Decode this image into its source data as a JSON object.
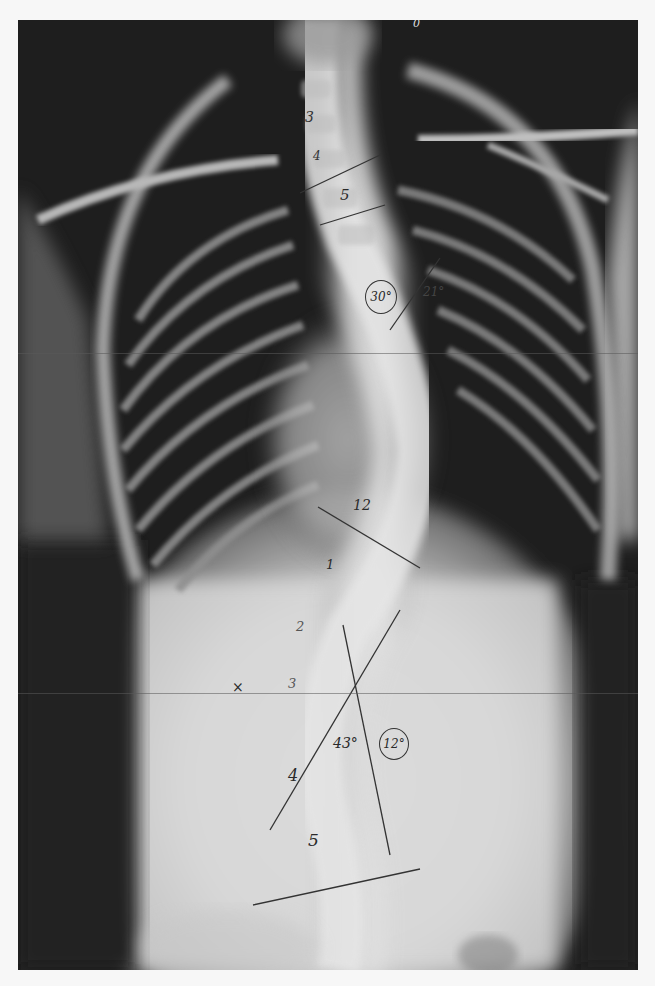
{
  "image": {
    "description": "Frontal (AP) radiograph of chest and spine showing scoliosis with handwritten Cobb angle measurements",
    "background_color": "#f7f7f7",
    "film_color": "#1c1c1c"
  },
  "annotations": {
    "top_mark": "0",
    "thoracic_levels": {
      "t3": "3",
      "t4": "4",
      "t5": "5",
      "t12": "12"
    },
    "thoracic_angle_circled": "30°",
    "thoracic_angle_side": "21°",
    "lumbar_levels": {
      "l1": "1",
      "l2": "2",
      "l3": "3",
      "l4": "4",
      "l5": "5"
    },
    "x_mark": "×",
    "lumbar_angle": "43°",
    "lumbar_angle_circled": "12°"
  },
  "measurement_lines": [
    {
      "name": "t4-endplate-line",
      "x1": 300,
      "y1": 193,
      "x2": 380,
      "y2": 155
    },
    {
      "name": "t5-endplate-line",
      "x1": 320,
      "y1": 225,
      "x2": 385,
      "y2": 205
    },
    {
      "name": "upper-angle-line",
      "x1": 390,
      "y1": 330,
      "x2": 440,
      "y2": 258
    },
    {
      "name": "t12-endplate-line",
      "x1": 318,
      "y1": 507,
      "x2": 420,
      "y2": 568
    },
    {
      "name": "l2-diagonal-line",
      "x1": 270,
      "y1": 830,
      "x2": 400,
      "y2": 610
    },
    {
      "name": "l-vertical-line",
      "x1": 343,
      "y1": 625,
      "x2": 390,
      "y2": 855
    },
    {
      "name": "l5-endplate-line",
      "x1": 253,
      "y1": 905,
      "x2": 420,
      "y2": 869
    }
  ]
}
